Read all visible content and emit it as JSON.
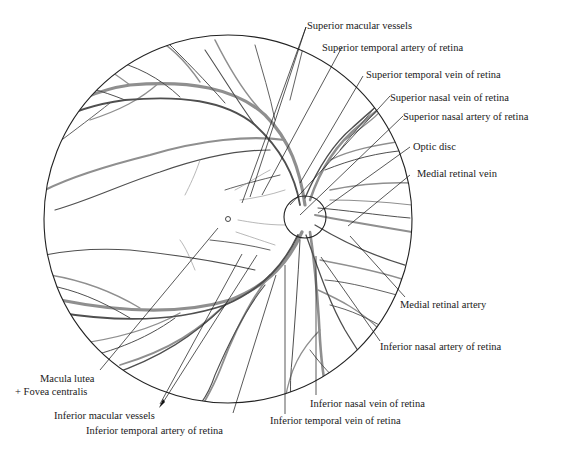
{
  "diagram": {
    "labels": {
      "superior_macular_vessels": "Superior macular vessels",
      "superior_temporal_artery": "Superior temporal artery of retina",
      "superior_temporal_vein": "Superior temporal vein of retina",
      "superior_nasal_vein": "Superior nasal vein of retina",
      "superior_nasal_artery": "Superior nasal artery of retina",
      "optic_disc": "Optic disc",
      "medial_retinal_vein": "Medial retinal vein",
      "medial_retinal_artery": "Medial retinal artery",
      "inferior_nasal_artery": "Inferior nasal artery of retina",
      "inferior_nasal_vein": "Inferior nasal vein of retina",
      "inferior_temporal_vein": "Inferior temporal vein of retina",
      "inferior_temporal_artery": "Inferior temporal artery of retina",
      "inferior_macular_vessels": "Inferior macular vessels",
      "macula_lutea": "Macula lutea",
      "fovea_centralis": "+ Fovea centralis"
    },
    "colors": {
      "outline": "#222222",
      "artery": "#555555",
      "vein": "#8a8a8a",
      "leader": "#111111",
      "background": "#ffffff"
    }
  }
}
